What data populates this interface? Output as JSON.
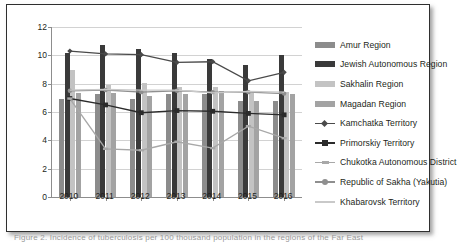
{
  "caption": {
    "partial_text": "Figure 2. Incidence of tuberculosis per 100 thousand population in the regions of the Far East"
  },
  "legend": {
    "position": "right",
    "items": [
      {
        "label": "Amur Region",
        "marker": "swatch",
        "color": "#8c8c8c"
      },
      {
        "label": "Jewish Autonomous Region",
        "marker": "swatch",
        "color": "#3a3a3a"
      },
      {
        "label": "Sakhalin Region",
        "marker": "swatch",
        "color": "#c3c3c3"
      },
      {
        "label": "Magadan Region",
        "marker": "swatch",
        "color": "#a3a3a3"
      },
      {
        "label": "Kamchatka Territory",
        "marker": "line-diamond",
        "color": "#4a4a4a"
      },
      {
        "label": "Primorskiy Territory",
        "marker": "line-square",
        "color": "#2b2b2b"
      },
      {
        "label": "Chukotka Autonomous District",
        "marker": "line-dash",
        "color": "#a8a8a8"
      },
      {
        "label": "Republic of Sakha (Yakutia)",
        "marker": "line-circle",
        "color": "#8f8f8f"
      },
      {
        "label": "Khabarovsk Territory",
        "marker": "line-plain",
        "color": "#c9c9c9"
      }
    ]
  },
  "chart_data": {
    "type": "bar",
    "title": "",
    "subtitle": "",
    "xlabel": "",
    "ylabel": "",
    "categories": [
      "2010",
      "2011",
      "2012",
      "2013",
      "2014",
      "2015",
      "2016"
    ],
    "ylim": [
      0,
      12
    ],
    "yticks": [
      0,
      2,
      4,
      6,
      8,
      10,
      12
    ],
    "ytick_labels": [
      "0",
      "2",
      "4",
      "6",
      "8",
      "10",
      "12"
    ],
    "grid": true,
    "legend_position": "right",
    "bar_series": [
      {
        "name": "Amur Region",
        "color": "#8c8c8c",
        "values": [
          6.95,
          7.25,
          6.95,
          7.25,
          7.25,
          6.75,
          6.8
        ]
      },
      {
        "name": "Jewish Autonomous Region",
        "color": "#3a3a3a",
        "values": [
          10.2,
          10.75,
          10.45,
          10.2,
          9.75,
          9.35,
          10.05
        ]
      },
      {
        "name": "Sakhalin Region",
        "color": "#c3c3c3",
        "values": [
          9.0,
          7.9,
          8.05,
          7.8,
          7.75,
          7.35,
          7.4
        ]
      },
      {
        "name": "Magadan Region",
        "color": "#a3a3a3",
        "values": [
          7.35,
          7.35,
          7.15,
          7.3,
          7.5,
          6.8,
          7.25
        ]
      }
    ],
    "line_series": [
      {
        "name": "Kamchatka Territory",
        "color": "#4a4a4a",
        "marker": "diamond",
        "values": [
          10.3,
          10.1,
          10.05,
          9.5,
          9.55,
          8.2,
          8.8
        ]
      },
      {
        "name": "Primorskiy Territory",
        "color": "#2b2b2b",
        "marker": "square",
        "values": [
          6.95,
          6.5,
          5.95,
          6.1,
          6.05,
          5.9,
          5.8
        ]
      },
      {
        "name": "Chukotka Autonomous District",
        "color": "#a8a8a8",
        "marker": "dash",
        "values": [
          6.95,
          3.4,
          3.3,
          3.9,
          3.45,
          5.0,
          4.15
        ]
      },
      {
        "name": "Republic of Sakha (Yakutia)",
        "color": "#8f8f8f",
        "marker": "circle",
        "values": [
          7.5,
          7.55,
          7.4,
          7.5,
          7.4,
          7.4,
          7.3
        ]
      },
      {
        "name": "Khabarovsk Territory",
        "color": "#c9c9c9",
        "marker": "none",
        "values": [
          7.55,
          7.6,
          7.55,
          7.55,
          7.35,
          7.45,
          7.4
        ]
      }
    ]
  }
}
